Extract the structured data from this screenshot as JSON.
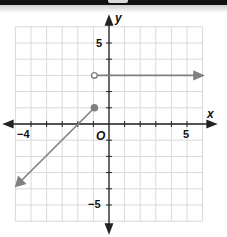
{
  "chart_data": {
    "type": "line",
    "title": "",
    "xlabel": "x",
    "ylabel": "y",
    "xlim": [
      -6,
      6
    ],
    "ylim": [
      -6,
      6
    ],
    "grid": true,
    "tick_labels": {
      "x": [
        "-4",
        "5"
      ],
      "y": [
        "5",
        "-5"
      ],
      "origin": "O"
    },
    "series": [
      {
        "name": "ray-left",
        "points": [
          [
            -1,
            1
          ],
          [
            -6,
            -4
          ]
        ],
        "start": "closed",
        "end": "arrow"
      },
      {
        "name": "ray-right",
        "points": [
          [
            -1,
            3
          ],
          [
            6,
            3
          ]
        ],
        "start": "open",
        "end": "arrow"
      }
    ],
    "colors": {
      "graph": "#808080",
      "grid": "#d9d9d9",
      "axes": "#222222"
    }
  },
  "labels": {
    "x_axis": "x",
    "y_axis": "y",
    "origin": "O",
    "x_neg4": "−4",
    "x_5": "5",
    "y_5": "5",
    "y_neg5": "−5"
  }
}
